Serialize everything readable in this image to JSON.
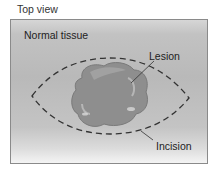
{
  "diagram": {
    "title": "Top view",
    "labels": {
      "tissue": "Normal tissue",
      "lesion": "Lesion",
      "incision": "Incision"
    },
    "colors": {
      "panel_border": "#8a8a8a",
      "lesion_fill": "#8e8e8e",
      "incision_line": "#333333",
      "text": "#222222"
    }
  }
}
